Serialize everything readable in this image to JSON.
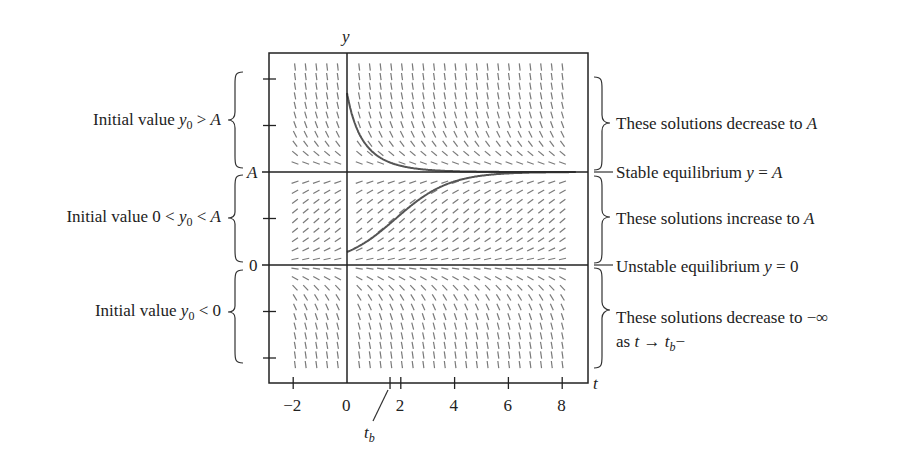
{
  "chart_data": {
    "type": "slope-field",
    "title": "",
    "equation_model": "dy/dt = r*y*(1 - y/A) (logistic)",
    "xlabel": "t",
    "ylabel": "y",
    "x_ticks": [
      -2,
      0,
      2,
      4,
      6,
      8
    ],
    "x_tick_labels": [
      "−2",
      "0",
      "2",
      "4",
      "6",
      "8"
    ],
    "xlim": [
      -2.8,
      9.1
    ],
    "y_tick_labels": [
      "A",
      "0"
    ],
    "y_ticks_in_units_of_A": [
      2,
      1.5,
      1,
      0.5,
      0,
      -0.5,
      -1
    ],
    "special_tick": {
      "label": "t",
      "subscript": "b",
      "value": 1.6
    },
    "equilibria": [
      {
        "y": "A",
        "type": "stable"
      },
      {
        "y": "0",
        "type": "unstable"
      }
    ],
    "solution_curves": [
      {
        "name": "y0 > A",
        "y0_over_A": 1.85,
        "behavior": "decreases to A"
      },
      {
        "name": "0 < y0 < A",
        "y0_over_A": 0.14,
        "behavior": "increases to A"
      },
      {
        "name": "y0 < 0",
        "y0_over_A": -0.25,
        "behavior": "decreases to -infinity as t -> t_b-"
      }
    ],
    "grid": false
  },
  "labels": {
    "left": [
      {
        "pre": "Initial value ",
        "var": "y",
        "sub": "0",
        "post": " > ",
        "var2": "A"
      },
      {
        "pre": "Initial value 0 < ",
        "var": "y",
        "sub": "0",
        "post": " < ",
        "var2": "A"
      },
      {
        "pre": "Initial value ",
        "var": "y",
        "sub": "0",
        "post": " < 0",
        "var2": ""
      }
    ],
    "right": {
      "decrease_to_A": {
        "text": "These solutions decrease to ",
        "var": "A"
      },
      "stable": {
        "text": "Stable equilibrium ",
        "var": "y",
        "post": " = ",
        "var2": "A"
      },
      "increase_to_A": {
        "text": "These solutions increase to ",
        "var": "A"
      },
      "unstable": {
        "text": "Unstable equilibrium ",
        "var": "y",
        "post": " = 0"
      },
      "decrease_to_neg_inf": {
        "text": "These solutions decrease to −∞"
      },
      "as_t": {
        "pre": "as ",
        "var": "t",
        "arrow": " → ",
        "var2": "t",
        "sub": "b",
        "post": "−"
      }
    },
    "axis": {
      "y": "y",
      "t": "t",
      "A": "A",
      "zero": "0",
      "tb": "t",
      "tb_sub": "b"
    }
  },
  "colors": {
    "axis": "#222222",
    "curve": "#555555",
    "slope": "#7a7a7a"
  }
}
